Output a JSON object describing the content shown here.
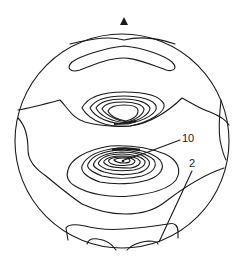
{
  "figure": {
    "type": "scalp topographic contour map",
    "nose_marker": "triangle-up",
    "stroke_color": "#1a1a1a",
    "background": "#ffffff"
  },
  "labels": [
    {
      "text": "10",
      "x": 182,
      "y": 142
    },
    {
      "text": "2",
      "x": 189,
      "y": 167
    }
  ]
}
